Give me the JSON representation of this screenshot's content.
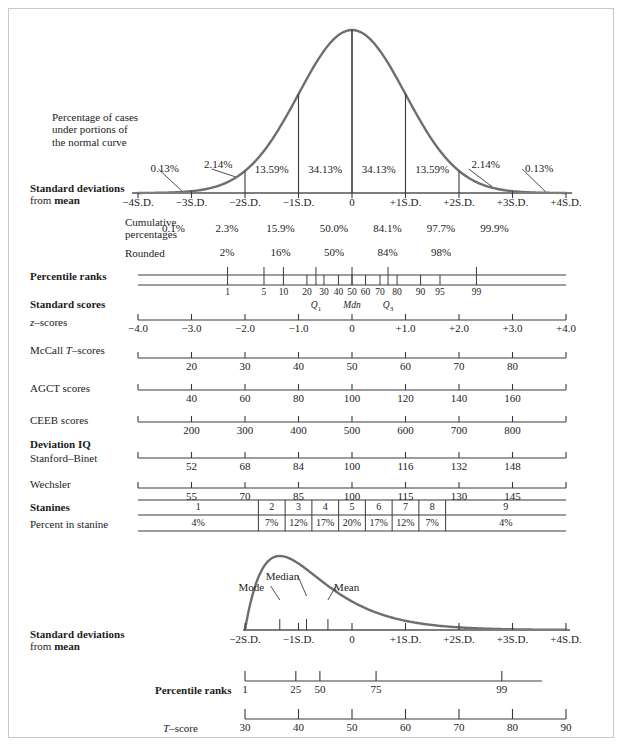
{
  "figure": {
    "caption_blocks": {
      "percentage_of_cases": "Percentage of cases\nunder portions of\nthe normal curve",
      "std_dev_label_line1": "Standard deviations",
      "std_dev_label_line2_pre": "from ",
      "std_dev_label_line2_bold": "mean",
      "cumulative_line1": "Cumulative",
      "cumulative_line2": "percentages",
      "rounded": "Rounded",
      "percentile_ranks": "Percentile ranks",
      "standard_scores": "Standard scores",
      "z_scores": "z–scores",
      "mccall": "McCall T–scores",
      "agct": "AGCT scores",
      "ceeb": "CEEB scores",
      "deviation_iq": "Deviation IQ",
      "stanford_binet": "Stanford–Binet",
      "wechsler": "Wechsler",
      "stanines": "Stanines",
      "percent_in_stanine": "Percent in stanine",
      "t_score": "T–score"
    }
  },
  "chart_data": {
    "type": "line",
    "xlabel": "Standard deviations from mean",
    "ylabel": "",
    "xlim": [
      -4,
      4
    ],
    "grid": false,
    "legend": "none",
    "normal_curve": {
      "description": "Standard normal (Gaussian) density curve",
      "x": [
        -4,
        -3,
        -2,
        -1,
        0,
        1,
        2,
        3,
        4
      ],
      "sd_tick_labels": [
        "−4S.D.",
        "−3S.D.",
        "−2S.D.",
        "−1S.D.",
        "0",
        "+1S.D.",
        "+2S.D.",
        "+3S.D.",
        "+4S.D."
      ],
      "band_percentages": [
        "0.13%",
        "2.14%",
        "13.59%",
        "34.13%",
        "34.13%",
        "13.59%",
        "2.14%",
        "0.13%"
      ],
      "band_midpoints_sd": [
        -3.5,
        -2.5,
        -1.5,
        -0.5,
        0.5,
        1.5,
        2.5,
        3.5
      ]
    },
    "cumulative_percentages": {
      "label": "Cumulative percentages",
      "at_sd": [
        -3,
        -2,
        -1,
        0,
        1,
        2,
        3
      ],
      "values": [
        "0.1%",
        "2.3%",
        "15.9%",
        "50.0%",
        "84.1%",
        "97.7%",
        "99.9%"
      ]
    },
    "rounded_percentages": {
      "label": "Rounded",
      "at_sd": [
        -2,
        -1,
        0,
        1,
        2
      ],
      "values": [
        "2%",
        "16%",
        "50%",
        "84%",
        "98%"
      ]
    },
    "percentile_ranks": {
      "label": "Percentile ranks",
      "ticks": [
        {
          "value": "1",
          "sd": -2.326
        },
        {
          "value": "5",
          "sd": -1.645
        },
        {
          "value": "10",
          "sd": -1.282
        },
        {
          "value": "20",
          "sd": -0.842
        },
        {
          "value": "30",
          "sd": -0.524
        },
        {
          "value": "40",
          "sd": -0.253
        },
        {
          "value": "50",
          "sd": 0
        },
        {
          "value": "60",
          "sd": 0.253
        },
        {
          "value": "70",
          "sd": 0.524
        },
        {
          "value": "80",
          "sd": 0.842
        },
        {
          "value": "90",
          "sd": 1.282
        },
        {
          "value": "95",
          "sd": 1.645
        },
        {
          "value": "99",
          "sd": 2.326
        }
      ],
      "quartiles": [
        {
          "label": "Q",
          "sub": "1",
          "sd": -0.674
        },
        {
          "label": "Mdn",
          "sub": "",
          "sd": 0
        },
        {
          "label": "Q",
          "sub": "3",
          "sd": 0.674
        }
      ]
    },
    "z_scores": {
      "label": "z–scores",
      "at_sd": [
        -4,
        -3,
        -2,
        -1,
        0,
        1,
        2,
        3,
        4
      ],
      "values": [
        "−4.0",
        "−3.0",
        "−2.0",
        "−1.0",
        "0",
        "+1.0",
        "+2.0",
        "+3.0",
        "+4.0"
      ]
    },
    "mccall_t_scores": {
      "label": "McCall T–scores",
      "at_sd": [
        -3,
        -2,
        -1,
        0,
        1,
        2,
        3
      ],
      "values": [
        "20",
        "30",
        "40",
        "50",
        "60",
        "70",
        "80"
      ]
    },
    "agct_scores": {
      "label": "AGCT scores",
      "at_sd": [
        -3,
        -2,
        -1,
        0,
        1,
        2,
        3
      ],
      "values": [
        "40",
        "60",
        "80",
        "100",
        "120",
        "140",
        "160"
      ]
    },
    "ceeb_scores": {
      "label": "CEEB scores",
      "at_sd": [
        -3,
        -2,
        -1,
        0,
        1,
        2,
        3
      ],
      "values": [
        "200",
        "300",
        "400",
        "500",
        "600",
        "700",
        "800"
      ]
    },
    "stanford_binet": {
      "label": "Stanford–Binet",
      "at_sd": [
        -3,
        -2,
        -1,
        0,
        1,
        2,
        3
      ],
      "values": [
        "52",
        "68",
        "84",
        "100",
        "116",
        "132",
        "148"
      ]
    },
    "wechsler": {
      "label": "Wechsler",
      "at_sd": [
        -3,
        -2,
        -1,
        0,
        1,
        2,
        3
      ],
      "values": [
        "55",
        "70",
        "85",
        "100",
        "115",
        "130",
        "145"
      ]
    },
    "stanines": {
      "label": "Stanines",
      "percent_label": "Percent in stanine",
      "bins": [
        "1",
        "2",
        "3",
        "4",
        "5",
        "6",
        "7",
        "8",
        "9"
      ],
      "percents": [
        "4%",
        "7%",
        "12%",
        "17%",
        "20%",
        "17%",
        "12%",
        "7%",
        "4%"
      ],
      "boundaries_sd": [
        -1.75,
        -1.25,
        -0.75,
        -0.25,
        0.25,
        0.75,
        1.25,
        1.75
      ]
    },
    "skewed_distribution": {
      "type": "line",
      "description": "Positively skewed distribution showing Mode, Median and Mean",
      "xlim": [
        -2,
        4
      ],
      "markers": [
        {
          "label": "Mode",
          "sd": -1.35
        },
        {
          "label": "Median",
          "sd": -0.85
        },
        {
          "label": "Mean",
          "sd": -0.45
        }
      ],
      "sd_axis": {
        "label_line1": "Standard deviations",
        "label_line2": "from mean",
        "at_sd": [
          -2,
          -1,
          0,
          1,
          2,
          3,
          4
        ],
        "values": [
          "−2S.D.",
          "−1S.D.",
          "0",
          "+1S.D.",
          "+2S.D.",
          "+3S.D.",
          "+4S.D."
        ]
      },
      "percentile_ranks": {
        "label": "Percentile ranks",
        "at_sd": [
          -2,
          -1.05,
          -0.6,
          0.45,
          2.8
        ],
        "values": [
          "1",
          "25",
          "50",
          "75",
          "99"
        ]
      },
      "t_score": {
        "label": "T–score",
        "at_sd": [
          -2,
          -1,
          0,
          1,
          2,
          3,
          4
        ],
        "values": [
          "30",
          "40",
          "50",
          "60",
          "70",
          "80",
          "90"
        ]
      }
    }
  },
  "colors": {
    "curve": "#6e6e6e",
    "axis": "#7d7d7d",
    "text": "#1c1c1c",
    "frame": "#c9c9c9",
    "background": "#ffffff"
  }
}
